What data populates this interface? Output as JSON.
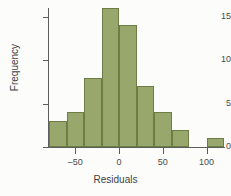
{
  "chart_data": {
    "type": "bar",
    "title": "",
    "xlabel": "Residuals",
    "ylabel": "Frequency",
    "xlim": [
      -80,
      120
    ],
    "ylim": [
      0,
      16
    ],
    "bin_width": 20,
    "grid": false,
    "legend": null,
    "xticks": [
      -50,
      0,
      50,
      100
    ],
    "xtick_labels": [
      "–50",
      "0",
      "50",
      "100"
    ],
    "yticks": [
      0,
      5,
      10,
      15
    ],
    "ytick_labels": [
      "0",
      "5",
      "10",
      "15"
    ],
    "bar_color": "#98a86c",
    "bar_edge_color": "#6e7c45",
    "bins": [
      {
        "left": -80,
        "right": -60,
        "center": -70,
        "value": 3
      },
      {
        "left": -60,
        "right": -40,
        "center": -50,
        "value": 4
      },
      {
        "left": -40,
        "right": -20,
        "center": -30,
        "value": 8
      },
      {
        "left": -20,
        "right": 0,
        "center": -10,
        "value": 16
      },
      {
        "left": 0,
        "right": 20,
        "center": 10,
        "value": 14
      },
      {
        "left": 20,
        "right": 40,
        "center": 30,
        "value": 7
      },
      {
        "left": 40,
        "right": 60,
        "center": 50,
        "value": 4
      },
      {
        "left": 60,
        "right": 80,
        "center": 70,
        "value": 2
      },
      {
        "left": 100,
        "right": 120,
        "center": 110,
        "value": 1
      }
    ],
    "categories": [
      "-70",
      "-50",
      "-30",
      "-10",
      "10",
      "30",
      "50",
      "70",
      "110"
    ],
    "values": [
      3,
      4,
      8,
      16,
      14,
      7,
      4,
      2,
      1
    ]
  }
}
